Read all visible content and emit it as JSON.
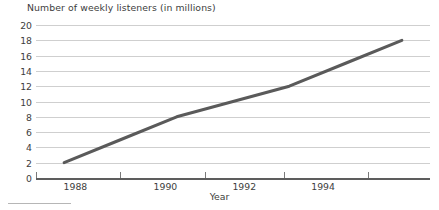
{
  "chart_data": {
    "type": "line",
    "title": "Number of weekly listeners (in millions)",
    "xlabel": "Year",
    "ylabel": "",
    "x": [
      1988,
      1989,
      1990,
      1991,
      1992,
      1993,
      1994
    ],
    "values": [
      2,
      5,
      8,
      10,
      12,
      15,
      18
    ],
    "series": [
      {
        "name": "Weekly listeners",
        "values": [
          2,
          5,
          8,
          10,
          12,
          15,
          18
        ]
      }
    ],
    "xlim": [
      1987.5,
      1994.5
    ],
    "ylim": [
      0,
      20
    ],
    "y_ticks": [
      0,
      2,
      4,
      6,
      8,
      10,
      12,
      14,
      16,
      18,
      20
    ],
    "y_tick_labels": [
      "0",
      "2",
      "4",
      "6",
      "8",
      "10",
      "12",
      "14",
      "16",
      "18",
      "20"
    ],
    "x_ticks": [
      1987.5,
      1989,
      1990.5,
      1991.9,
      1993.4,
      1994.8
    ],
    "x_tick_labels": [
      "1988",
      "1990",
      "1992",
      "1994"
    ],
    "x_tick_label_positions": [
      1988.2,
      1989.8,
      1991.2,
      1992.6
    ],
    "grid": "horizontal",
    "legend": "none",
    "line_color": "#5a5a5a",
    "line_width": 3,
    "gridline_color": "#cfcfcf",
    "axis_color": "#5d5d5d",
    "background_color": "#ffffff"
  },
  "footnote": {
    "rule_visible": true
  }
}
